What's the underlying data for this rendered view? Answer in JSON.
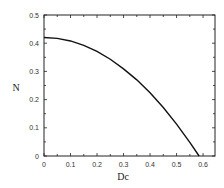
{
  "chart_data": {
    "type": "line",
    "title": "",
    "xlabel": "Dc",
    "ylabel": "N",
    "xlim": [
      0,
      0.645
    ],
    "ylim": [
      0,
      0.5
    ],
    "grid": false,
    "legend": null,
    "xticks": [
      "0",
      "0.1",
      "0.2",
      "0.3",
      "0.4",
      "0.5",
      "0.6"
    ],
    "yticks": [
      "0",
      "0.1",
      "0.2",
      "0.3",
      "0.4",
      "0.5"
    ],
    "series": [
      {
        "name": "N vs Dc",
        "color": "#111111",
        "x": [
          0,
          0.05,
          0.1,
          0.15,
          0.2,
          0.25,
          0.3,
          0.35,
          0.4,
          0.45,
          0.5,
          0.55,
          0.585
        ],
        "y": [
          0.42,
          0.417,
          0.408,
          0.392,
          0.371,
          0.343,
          0.309,
          0.27,
          0.224,
          0.172,
          0.113,
          0.048,
          0.0
        ]
      }
    ]
  }
}
